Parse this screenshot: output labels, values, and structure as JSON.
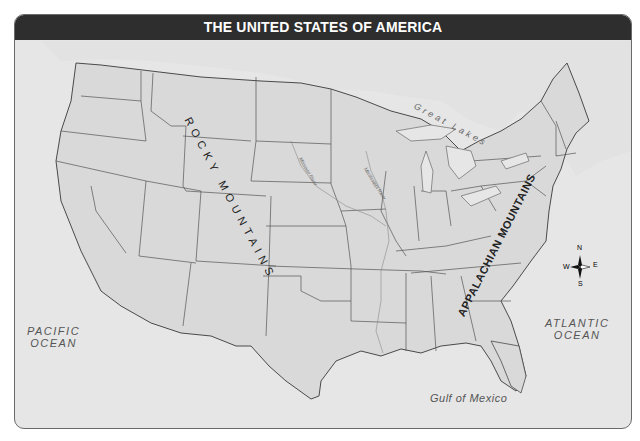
{
  "title": "THE UNITED STATES OF AMERICA",
  "labels": {
    "pacific": "PACIFIC OCEAN",
    "pacific_line1": "PACIFIC",
    "pacific_line2": "OCEAN",
    "atlantic_line1": "ATLANTIC",
    "atlantic_line2": "OCEAN",
    "gulf": "Gulf of Mexico",
    "great_lakes": "Great Lakes",
    "rocky_mountains": "ROCKY MOUNTAINS",
    "appalachian_mountains": "APPALACHIAN MOUNTAINS",
    "missouri_river": "Missouri River",
    "mississippi_river": "Mississippi River"
  },
  "compass": {
    "n": "N",
    "s": "S",
    "e": "E",
    "w": "W"
  },
  "colors": {
    "header_bg": "#2e2e2e",
    "land": "#d9d9d9",
    "water": "#e6e6e6",
    "border": "#555555"
  }
}
